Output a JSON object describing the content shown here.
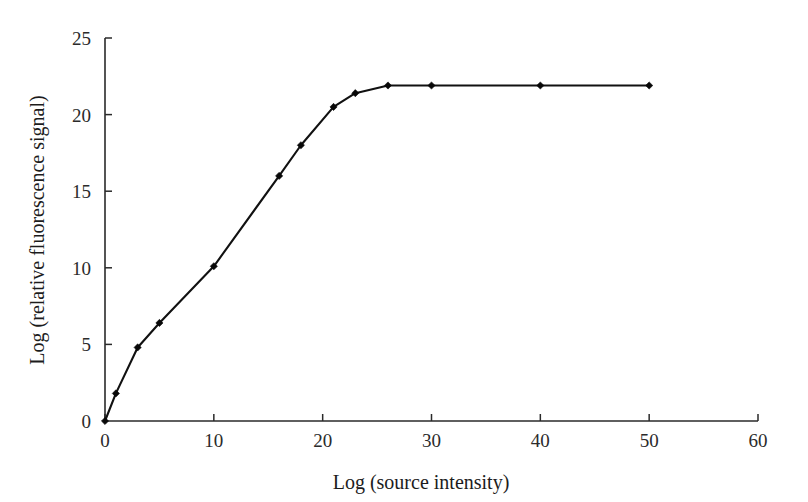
{
  "chart_data": {
    "type": "line",
    "title": "",
    "subtitle": "",
    "xlabel": "Log (source intensity)",
    "ylabel": "Log (relative fluorescence signal)",
    "xlim": [
      0,
      60
    ],
    "ylim": [
      0,
      25
    ],
    "xticks": [
      0,
      10,
      20,
      30,
      40,
      50,
      60
    ],
    "yticks": [
      0,
      5,
      10,
      15,
      20,
      25
    ],
    "xtick_labels": [
      "0",
      "10",
      "20",
      "30",
      "40",
      "50",
      "60"
    ],
    "ytick_labels": [
      "0",
      "5",
      "10",
      "15",
      "20",
      "25"
    ],
    "grid": false,
    "legend": false,
    "legend_position": "none",
    "marker": "diamond",
    "line_color": "#111111",
    "marker_color": "#080808",
    "annotations": [],
    "series": [
      {
        "name": "relative fluorescence signal",
        "x": [
          0,
          1,
          3,
          5,
          10,
          16,
          18,
          21,
          23,
          26,
          30,
          40,
          50
        ],
        "y": [
          0,
          1.8,
          4.8,
          6.4,
          10.1,
          16.0,
          18.0,
          20.5,
          21.4,
          21.9,
          21.9,
          21.9,
          21.9
        ]
      }
    ]
  },
  "figure": {
    "background_color": "#ffffff",
    "axis_color": "#2a2a2a",
    "text_color": "#1c1c1c"
  }
}
